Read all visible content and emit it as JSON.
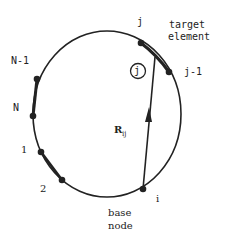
{
  "diagram": {
    "nodes": {
      "j": "j",
      "j_minus_1": "j-1",
      "n_minus_1": "N-1",
      "n": "N",
      "one": "1",
      "two": "2",
      "i": "i"
    },
    "target_element_label": [
      "target",
      "element"
    ],
    "base_node_label": [
      "base",
      "node"
    ],
    "circled_label": "j",
    "vector_label": "R",
    "vector_subscript": "ij",
    "colors": {
      "stroke": "#222222",
      "background": "#ffffff"
    }
  }
}
